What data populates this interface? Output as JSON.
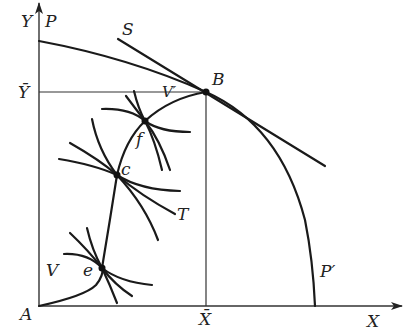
{
  "diagram": {
    "type": "production-possibility / contract-curve diagram",
    "axes": {
      "origin_label": "A",
      "x_label": "X",
      "y_label": "Y",
      "x_bar_label": "X̄",
      "y_bar_label": "Ȳ"
    },
    "curves": {
      "ppf_top_label": "P",
      "ppf_bottom_label": "P′",
      "price_line_label": "S",
      "contract_curve_start_label": "V",
      "contract_curve_end_label": "V′",
      "tangent_label": "T"
    },
    "points": [
      {
        "id": "B",
        "label": "B"
      },
      {
        "id": "f",
        "label": "f"
      },
      {
        "id": "c",
        "label": "c"
      },
      {
        "id": "e",
        "label": "e"
      }
    ]
  }
}
